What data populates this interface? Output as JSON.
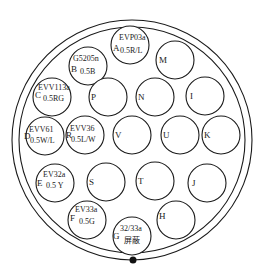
{
  "diagram": {
    "type": "connector-pinout",
    "colors": {
      "line": "#1a1a1a",
      "text": "#222222",
      "background": "#ffffff"
    },
    "pins": [
      {
        "id": "A",
        "code": "EVP03a",
        "wire": "0.5R/L"
      },
      {
        "id": "B",
        "code": "G5205n",
        "wire": "0.5B"
      },
      {
        "id": "M",
        "code": "",
        "wire": ""
      },
      {
        "id": "C",
        "code": "EVV113a",
        "wire": "0.5RG"
      },
      {
        "id": "P",
        "code": "",
        "wire": ""
      },
      {
        "id": "N",
        "code": "",
        "wire": ""
      },
      {
        "id": "I",
        "code": "",
        "wire": ""
      },
      {
        "id": "D",
        "code": "EVV61",
        "wire": "0.5W/L"
      },
      {
        "id": "R",
        "code": "EVV36",
        "wire": "0.5L/W"
      },
      {
        "id": "V",
        "code": "",
        "wire": ""
      },
      {
        "id": "U",
        "code": "",
        "wire": ""
      },
      {
        "id": "K",
        "code": "",
        "wire": ""
      },
      {
        "id": "E",
        "code": "EV32a",
        "wire": "0.5 Y"
      },
      {
        "id": "S",
        "code": "",
        "wire": ""
      },
      {
        "id": "T",
        "code": "",
        "wire": ""
      },
      {
        "id": "J",
        "code": "",
        "wire": ""
      },
      {
        "id": "F",
        "code": "EV33a",
        "wire": "0.5G"
      },
      {
        "id": "G",
        "code": "32/33a",
        "wire": "屏蔽"
      },
      {
        "id": "H",
        "code": "",
        "wire": ""
      }
    ]
  }
}
